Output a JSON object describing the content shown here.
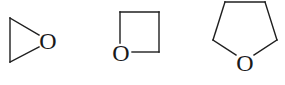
{
  "diagram": {
    "background": "#ffffff",
    "line_color": "#1f1f1f",
    "molecules": [
      {
        "name": "oxirane",
        "ring_size": 3,
        "heteroatom_label": "O",
        "bonds": [
          [
            10,
            18,
            10,
            62
          ],
          [
            10,
            18,
            39,
            35
          ],
          [
            10,
            62,
            39,
            47
          ]
        ],
        "label_pos": [
          48,
          41
        ]
      },
      {
        "name": "oxetane",
        "ring_size": 4,
        "heteroatom_label": "O",
        "bonds": [
          [
            120,
            12,
            159,
            12
          ],
          [
            159,
            12,
            159,
            52
          ],
          [
            159,
            52,
            132,
            52
          ],
          [
            120,
            12,
            120,
            43
          ]
        ],
        "label_pos": [
          121,
          53
        ]
      },
      {
        "name": "tetrahydrofuran",
        "ring_size": 5,
        "heteroatom_label": "O",
        "bonds": [
          [
            225,
            2,
            265,
            2
          ],
          [
            265,
            2,
            277,
            40
          ],
          [
            277,
            40,
            254,
            55
          ],
          [
            213,
            40,
            225,
            2
          ],
          [
            213,
            40,
            236,
            55
          ]
        ],
        "label_pos": [
          245,
          62
        ]
      }
    ]
  }
}
